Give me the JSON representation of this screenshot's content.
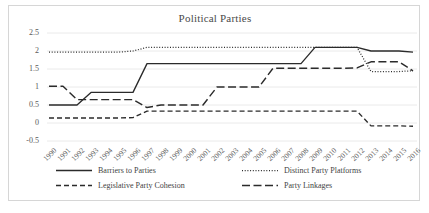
{
  "chart_data": {
    "type": "line",
    "title": "Political Parties",
    "xlabel": "",
    "ylabel": "",
    "ylim": [
      -0.5,
      2.5
    ],
    "yticks": [
      "-0.5",
      "0",
      "0.5",
      "1",
      "1.5",
      "2",
      "2.5"
    ],
    "grid": true,
    "legend_position": "bottom",
    "categories": [
      "1990",
      "1991",
      "1992",
      "1993",
      "1994",
      "1995",
      "1996",
      "1997",
      "1998",
      "1999",
      "2000",
      "2001",
      "2002",
      "2003",
      "2004",
      "2005",
      "2006",
      "2007",
      "2008",
      "2009",
      "2010",
      "2011",
      "2012",
      "2013",
      "2014",
      "2015",
      "2016"
    ],
    "series": [
      {
        "name": "Barriers to Parties",
        "style": "solid",
        "color": "#2b2b2b",
        "values": [
          0.5,
          0.5,
          0.5,
          0.85,
          0.85,
          0.85,
          0.85,
          1.65,
          1.65,
          1.65,
          1.65,
          1.65,
          1.65,
          1.65,
          1.65,
          1.65,
          1.65,
          1.65,
          1.65,
          2.1,
          2.1,
          2.1,
          2.1,
          2.0,
          2.0,
          2.0,
          1.97
        ]
      },
      {
        "name": "Distinct Party Platforms",
        "style": "dotted",
        "color": "#2b2b2b",
        "values": [
          1.97,
          1.97,
          1.97,
          1.97,
          1.97,
          1.97,
          2.0,
          2.1,
          2.1,
          2.1,
          2.1,
          2.1,
          2.1,
          2.1,
          2.1,
          2.1,
          2.1,
          2.1,
          2.1,
          2.1,
          2.1,
          2.1,
          2.1,
          1.43,
          1.43,
          1.43,
          1.45
        ]
      },
      {
        "name": "Legislative Party Cohesion",
        "style": "dashed",
        "color": "#2b2b2b",
        "values": [
          0.14,
          0.14,
          0.14,
          0.14,
          0.14,
          0.14,
          0.15,
          0.33,
          0.33,
          0.33,
          0.33,
          0.33,
          0.33,
          0.33,
          0.33,
          0.33,
          0.33,
          0.33,
          0.33,
          0.33,
          0.33,
          0.33,
          0.33,
          -0.08,
          -0.08,
          -0.08,
          -0.09
        ]
      },
      {
        "name": "Party Linkages",
        "style": "longdash",
        "color": "#2b2b2b",
        "values": [
          1.02,
          1.02,
          0.65,
          0.65,
          0.65,
          0.65,
          0.65,
          0.43,
          0.5,
          0.5,
          0.5,
          0.5,
          1.0,
          1.0,
          1.0,
          1.0,
          1.52,
          1.52,
          1.52,
          1.52,
          1.52,
          1.52,
          1.53,
          1.7,
          1.7,
          1.7,
          1.45
        ]
      }
    ]
  },
  "legend": {
    "items": [
      {
        "label": "Barriers to Parties",
        "style": "solid"
      },
      {
        "label": "Distinct Party Platforms",
        "style": "dotted"
      },
      {
        "label": "Legislative Party Cohesion",
        "style": "dashed"
      },
      {
        "label": "Party Linkages",
        "style": "longdash"
      }
    ]
  }
}
